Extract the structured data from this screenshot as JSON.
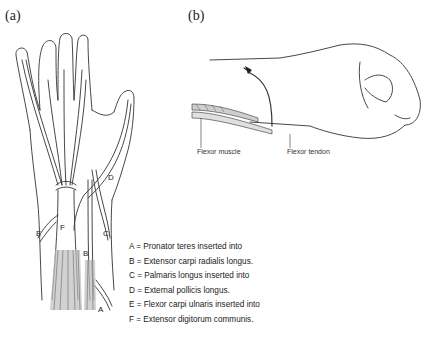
{
  "panels": {
    "a": {
      "label": "(a)"
    },
    "b": {
      "label": "(b)"
    }
  },
  "figure_a": {
    "tendon_labels": [
      "A",
      "B",
      "C",
      "D",
      "E",
      "F"
    ],
    "legend": [
      {
        "key": "A",
        "text": "A = Pronator teres inserted into"
      },
      {
        "key": "B",
        "text": "B = Extensor carpi radialis longus."
      },
      {
        "key": "C",
        "text": "C = Palmaris longus inserted into"
      },
      {
        "key": "D",
        "text": "D = External pollicis longus."
      },
      {
        "key": "E",
        "text": "E = Flexor carpi ulnaris inserted into"
      },
      {
        "key": "F",
        "text": "F = Extensor digitorum communis."
      }
    ]
  },
  "figure_b": {
    "captions": {
      "muscle": "Flexor muscle",
      "tendon": "Flexor tendon"
    }
  },
  "colors": {
    "line": "#333333",
    "muscle_shade": "#bdbdbd",
    "background": "#ffffff"
  }
}
